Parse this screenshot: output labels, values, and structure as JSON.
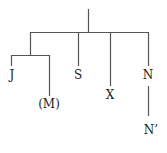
{
  "diagram": {
    "type": "tree",
    "line_color": "#555555",
    "nodes": {
      "j": "J",
      "m": "(M)",
      "s": "S",
      "x": "X",
      "n": "N",
      "n_prime": "N’"
    }
  }
}
